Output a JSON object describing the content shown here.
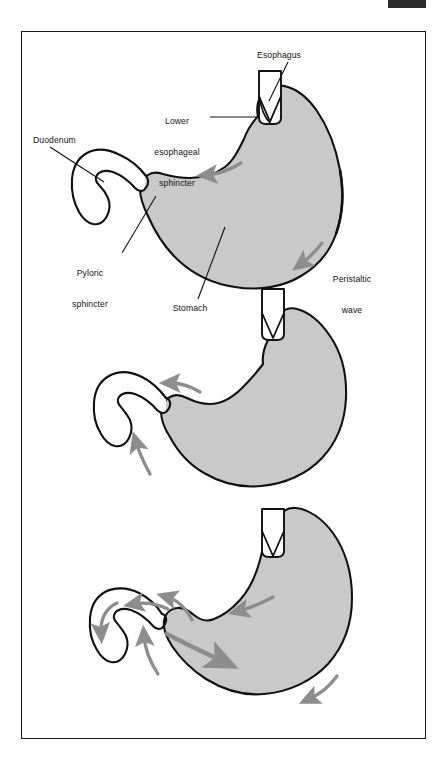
{
  "figure": {
    "domain_note": "anatomical line diagram",
    "panel_count": 3,
    "page_marker": "black-registration-bar"
  },
  "colors": {
    "organ_fill": "#c9c9c9",
    "organ_outline": "#111111",
    "arrow": "#8d8d8d",
    "arrow_dark": "#7a7a7a",
    "frame": "#1a1a1a",
    "label_text": "#111111",
    "background": "#ffffff",
    "marker": "#2b2b2b"
  },
  "labels": [
    {
      "id": "esophagus",
      "text": "Esophagus",
      "lines": [
        "Esophagus"
      ],
      "align": "center",
      "x": 247,
      "y": 50,
      "leader": "diagonal-down-left"
    },
    {
      "id": "lower-esophageal-sphincter",
      "text": "Lower esophageal sphincter",
      "lines": [
        "Lower",
        "esophageal",
        "sphincter"
      ],
      "align": "center",
      "x": 160,
      "y": 95,
      "leader": "horizontal-right"
    },
    {
      "id": "duodenum",
      "text": "Duodenum",
      "lines": [
        "Duodenum"
      ],
      "align": "left",
      "x": 33,
      "y": 135,
      "leader": "diagonal-down-right"
    },
    {
      "id": "pyloric-sphincter",
      "text": "Pyloric sphincter",
      "lines": [
        "Pyloric",
        "sphincter"
      ],
      "align": "center",
      "x": 70,
      "y": 247,
      "leader": "diagonal-up-right"
    },
    {
      "id": "stomach",
      "text": "Stomach",
      "lines": [
        "Stomach"
      ],
      "align": "center",
      "x": 160,
      "y": 303,
      "leader": "diagonal-up-right"
    },
    {
      "id": "peristaltic-wave",
      "text": "Peristaltic wave",
      "lines": [
        "Peristaltic",
        "wave"
      ],
      "align": "center",
      "x": 345,
      "y": 253,
      "leader": "none"
    }
  ],
  "panels": [
    {
      "id": "panel-1",
      "index": 1,
      "caption": "",
      "arrows": 2,
      "arrow_names": [
        "peristaltic-wave-arrow-upper",
        "peristaltic-wave-arrow-lower"
      ],
      "labelled": true
    },
    {
      "id": "panel-2",
      "index": 2,
      "caption": "",
      "arrows": 2,
      "arrow_names": [
        "retropulsion-arrow-antrum",
        "retropulsion-arrow-lower"
      ],
      "labelled": false
    },
    {
      "id": "panel-3",
      "index": 3,
      "caption": "",
      "arrows": 7,
      "arrow_names": [
        "duodenum-flow-arrow",
        "pyloric-backflow-arrow",
        "antral-mixing-arrow",
        "chyme-propulsion-arrow",
        "retropulsion-arrow-up",
        "body-wave-arrow",
        "greater-curvature-arrow"
      ],
      "labelled": false
    }
  ]
}
